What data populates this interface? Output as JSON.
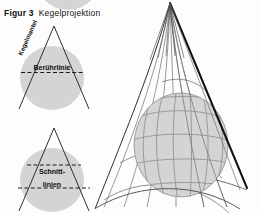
{
  "figure": {
    "number_label": "Figur 3",
    "title": "Kegelprojektion"
  },
  "diagrams": {
    "tangent_cone": {
      "name": "Tangentialkegel",
      "cone_surface_label": "Kegelmantel",
      "contact_line_label": "Berührlinie"
    },
    "secant_cone": {
      "name": "Schnittkegel",
      "intersection_label_line1": "Schnitt-",
      "intersection_label_line2": "linien"
    },
    "perspective": {
      "name": "Kegel über Globus",
      "elements": [
        "Kegelmantel",
        "Globus",
        "Meridiane",
        "Breitenkreise",
        "Kegelspitze"
      ]
    }
  },
  "colors": {
    "sphere_fill": "#d4d4d4",
    "sphere_stroke": "#8f8f8f",
    "line": "#2e2e2e",
    "thick_edge": "#111111",
    "grid": "#8c8c8c",
    "text": "#0d0d0d",
    "background": "#fdfdfd"
  },
  "geometry": {
    "tangent_circle": {
      "cx": 52,
      "cy": 78,
      "r": 32
    },
    "secant_circle": {
      "cx": 52,
      "cy": 180,
      "r": 32
    },
    "top_partial_circle": {
      "cx": 68,
      "cy": -22,
      "r": 32
    },
    "tangent_apex": {
      "x": 54,
      "y": 26
    },
    "secant_apex": {
      "x": 54,
      "y": 128
    },
    "cone_apex": {
      "x": 170,
      "y": 3
    },
    "globe": {
      "cx": 181,
      "cy": 145,
      "rx": 47,
      "ry": 52
    }
  }
}
